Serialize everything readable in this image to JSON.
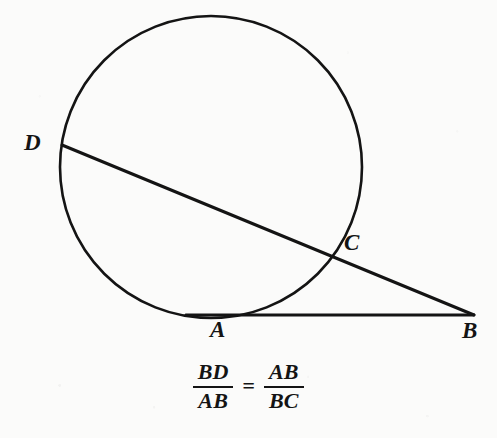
{
  "figure": {
    "type": "geometry-diagram",
    "background_color": "#fbfbfa",
    "stroke_color": "#141414",
    "circle": {
      "center_x": 211,
      "center_y": 167,
      "radius": 151,
      "stroke_width": 2.6
    },
    "points": [
      {
        "id": "D",
        "label": "D",
        "x": 62,
        "y": 145,
        "label_x": 24,
        "label_y": 131,
        "role": "secant-far-endpoint-on-circle"
      },
      {
        "id": "C",
        "label": "C",
        "x": 330,
        "y": 251,
        "label_x": 344,
        "label_y": 231,
        "role": "secant-near-intersection-on-circle"
      },
      {
        "id": "A",
        "label": "A",
        "x": 213,
        "y": 315,
        "label_x": 210,
        "label_y": 318,
        "role": "tangent-point"
      },
      {
        "id": "B",
        "label": "B",
        "x": 472,
        "y": 314,
        "label_x": 462,
        "label_y": 319,
        "role": "external-vertex"
      }
    ],
    "lines": [
      {
        "id": "secant-DB",
        "from": "D",
        "to": "B",
        "x1": 62,
        "y1": 145,
        "x2": 474,
        "y2": 315,
        "stroke_width": 3.0
      },
      {
        "id": "tangent-AB",
        "from": "A",
        "to": "B",
        "x1": 186,
        "y1": 315,
        "x2": 474,
        "y2": 315,
        "stroke_width": 2.8
      }
    ]
  },
  "formula": {
    "text": "BD/AB = AB/BC",
    "left_fraction": {
      "numerator": "BD",
      "denominator": "AB"
    },
    "operator": "=",
    "right_fraction": {
      "numerator": "AB",
      "denominator": "BC"
    }
  }
}
